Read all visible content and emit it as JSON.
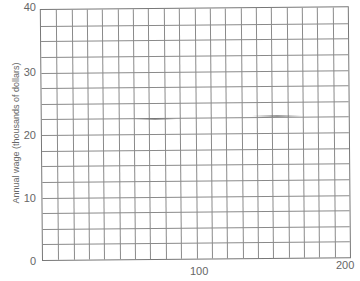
{
  "chart_data": {
    "type": "line",
    "title": "",
    "xlabel": "",
    "ylabel": "Annual wage (thousands of dollars)",
    "xlim": [
      0,
      200
    ],
    "ylim": [
      0,
      40
    ],
    "x_ticks": [
      0,
      100,
      200
    ],
    "x_tick_labels": [
      "",
      "100",
      "200"
    ],
    "y_ticks": [
      0,
      10,
      20,
      30,
      40
    ],
    "y_tick_labels": [
      "0",
      "10",
      "20",
      "30",
      "40"
    ],
    "grid": true,
    "grid_x_step": 10,
    "grid_y_step": 2.5,
    "series": [],
    "legend": null,
    "note": "Blank graph-paper grid; x-axis label is cut off at the bottom edge"
  },
  "axes": {
    "ylabel": "Annual wage (thousands of dollars)",
    "yticks": [
      "40",
      "30",
      "20",
      "10",
      "0"
    ],
    "xticks": [
      "100",
      "200"
    ]
  },
  "colors": {
    "grid": "#8a8a8a",
    "text": "#666666",
    "background": "#ffffff"
  }
}
